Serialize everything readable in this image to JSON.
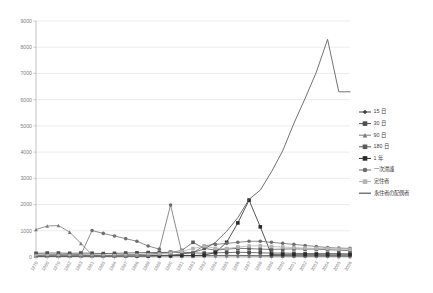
{
  "chart_data": {
    "type": "line",
    "title": "",
    "subtitle": "",
    "xlabel": "",
    "ylabel": "",
    "ylim": [
      0,
      9000
    ],
    "ytick_labels": [
      "0",
      "1000",
      "2000",
      "3000",
      "4000",
      "5000",
      "6000",
      "7000",
      "8000",
      "9000"
    ],
    "ytick_values": [
      0,
      1000,
      2000,
      3000,
      4000,
      5000,
      6000,
      7000,
      8000,
      9000
    ],
    "grid": true,
    "legend_position": "right",
    "categories": [
      "1978",
      "1980",
      "1979",
      "1982",
      "1983",
      "1981",
      "1985",
      "1984",
      "1987",
      "1986",
      "1988",
      "1989",
      "1990",
      "1991",
      "1993",
      "1992",
      "1994",
      "1995",
      "1996",
      "1997",
      "1998",
      "1999",
      "2000",
      "2001",
      "2002",
      "2003",
      "2004",
      "2005",
      "2006"
    ],
    "series": [
      {
        "name": "15 日",
        "color": "#3f3f3f",
        "marker": "diamond",
        "values": [
          60,
          70,
          75,
          70,
          80,
          70,
          60,
          55,
          60,
          55,
          50,
          60,
          55,
          60,
          55,
          50,
          55,
          60,
          60,
          55,
          50,
          55,
          50,
          45,
          40,
          40,
          40,
          40,
          35
        ]
      },
      {
        "name": "30 日",
        "color": "#4d4d4d",
        "marker": "square",
        "values": [
          140,
          150,
          150,
          140,
          150,
          145,
          130,
          140,
          150,
          160,
          170,
          170,
          180,
          160,
          150,
          150,
          160,
          170,
          180,
          170,
          160,
          150,
          150,
          140,
          130,
          130,
          130,
          130,
          120
        ]
      },
      {
        "name": "90 日",
        "color": "#7a7a7a",
        "marker": "triangle",
        "values": [
          1050,
          1180,
          1200,
          950,
          520,
          80,
          60,
          60,
          70,
          60,
          60,
          60,
          60,
          55,
          50,
          50,
          50,
          45,
          45,
          40,
          40,
          35,
          35,
          30,
          30,
          30,
          30,
          25,
          25
        ]
      },
      {
        "name": "180 日",
        "color": "#5a5a5a",
        "marker": "square",
        "values": [
          40,
          45,
          45,
          45,
          50,
          55,
          60,
          70,
          80,
          90,
          110,
          140,
          170,
          250,
          560,
          330,
          260,
          300,
          330,
          320,
          300,
          290,
          300,
          310,
          300,
          300,
          280,
          260,
          240
        ]
      },
      {
        "name": "1 年",
        "color": "#2b2b2b",
        "marker": "square",
        "values": [
          30,
          30,
          30,
          30,
          30,
          30,
          30,
          35,
          35,
          35,
          40,
          40,
          45,
          50,
          55,
          70,
          170,
          560,
          1300,
          2170,
          1150,
          90,
          85,
          85,
          85,
          85,
          80,
          80,
          80
        ]
      },
      {
        "name": "一次滞護",
        "color": "#6e6e6e",
        "marker": "circle",
        "values": [
          70,
          75,
          80,
          80,
          85,
          1010,
          900,
          800,
          700,
          600,
          420,
          300,
          1980,
          180,
          170,
          430,
          480,
          520,
          560,
          600,
          600,
          560,
          520,
          480,
          440,
          400,
          360,
          340,
          330
        ]
      },
      {
        "name": "定住者",
        "color": "#b3b3b3",
        "marker": "square",
        "values": [
          35,
          35,
          35,
          35,
          35,
          35,
          40,
          45,
          50,
          60,
          80,
          110,
          150,
          220,
          320,
          420,
          330,
          320,
          380,
          420,
          430,
          400,
          380,
          360,
          340,
          330,
          320,
          300,
          290
        ]
      },
      {
        "name": "永住者の配偶者",
        "color": "#595959",
        "marker": "none",
        "values": [
          20,
          20,
          20,
          20,
          25,
          25,
          25,
          30,
          30,
          35,
          40,
          50,
          70,
          110,
          180,
          300,
          560,
          980,
          1500,
          2200,
          2550,
          3250,
          4050,
          5100,
          6050,
          7050,
          8300,
          6300,
          6300
        ]
      }
    ],
    "peak_annotation": {
      "series": "永住者の配偶者",
      "value": 8300,
      "year": "2004"
    }
  },
  "legend": {
    "items": [
      {
        "label": "15 日"
      },
      {
        "label": "30 日"
      },
      {
        "label": "90 日"
      },
      {
        "label": "180 日"
      },
      {
        "label": "1 年"
      },
      {
        "label": "一次滞護"
      },
      {
        "label": "定住者"
      },
      {
        "label": "永住者の配偶者"
      }
    ]
  },
  "colors": {
    "grid": "#d9d9d9",
    "axis": "#9a9a9a",
    "tick_text": "#808080",
    "legend_text": "#3f3f3f",
    "background": "#ffffff"
  }
}
